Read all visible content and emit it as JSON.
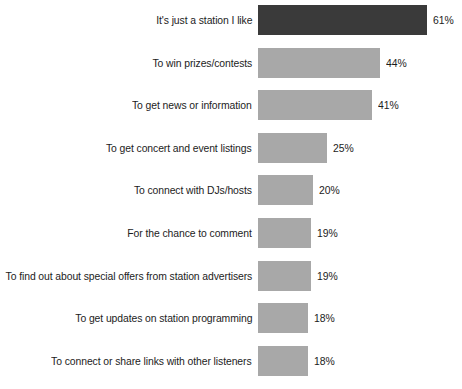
{
  "chart_data": {
    "type": "bar",
    "orientation": "horizontal",
    "title": "",
    "subtitle": "",
    "xlabel": "",
    "ylabel": "",
    "grid": false,
    "legend": false,
    "xlim": [
      0,
      61
    ],
    "value_suffix": "%",
    "categories": [
      "It's just a station I like",
      "To win prizes/contests",
      "To get news or information",
      "To get concert and event listings",
      "To connect with DJs/hosts",
      "For the chance to comment",
      "To find out about special offers from station advertisers",
      "To get updates on station programming",
      "To connect or share links with other listeners"
    ],
    "values": [
      61,
      44,
      41,
      25,
      20,
      19,
      19,
      18,
      18
    ],
    "value_labels": [
      "61%",
      "44%",
      "41%",
      "25%",
      "20%",
      "19%",
      "19%",
      "18%",
      "18%"
    ],
    "bar_colors": [
      "#3a3a3a",
      "#a8a8a8",
      "#a8a8a8",
      "#a8a8a8",
      "#a8a8a8",
      "#a8a8a8",
      "#a8a8a8",
      "#a8a8a8",
      "#a8a8a8"
    ],
    "background_color": "#ffffff",
    "text_color": "#1c1c1c"
  }
}
